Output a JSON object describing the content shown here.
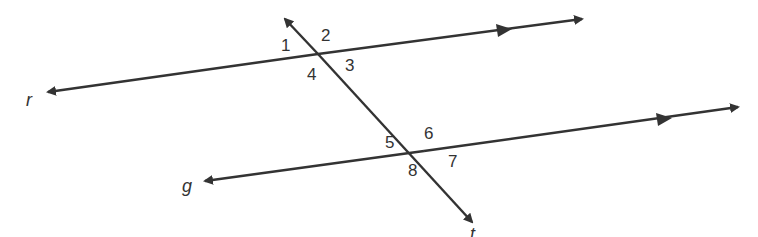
{
  "diagram": {
    "lines": [
      {
        "name": "r",
        "label": "r",
        "from": [
          48,
          92
        ],
        "to": [
          582,
          19
        ],
        "parallel_marker": [
          505,
          30
        ]
      },
      {
        "name": "g",
        "label": "g",
        "from": [
          205,
          181
        ],
        "to": [
          738,
          107
        ],
        "parallel_marker": [
          666,
          118
        ]
      },
      {
        "name": "t",
        "label": "t",
        "from": [
          285,
          19
        ],
        "to": [
          472,
          222
        ]
      }
    ],
    "line_labels": {
      "r": "r",
      "g": "g",
      "t": "t"
    },
    "angles": {
      "a1": "1",
      "a2": "2",
      "a3": "3",
      "a4": "4",
      "a5": "5",
      "a6": "6",
      "a7": "7",
      "a8": "8"
    },
    "color": "#333333"
  }
}
